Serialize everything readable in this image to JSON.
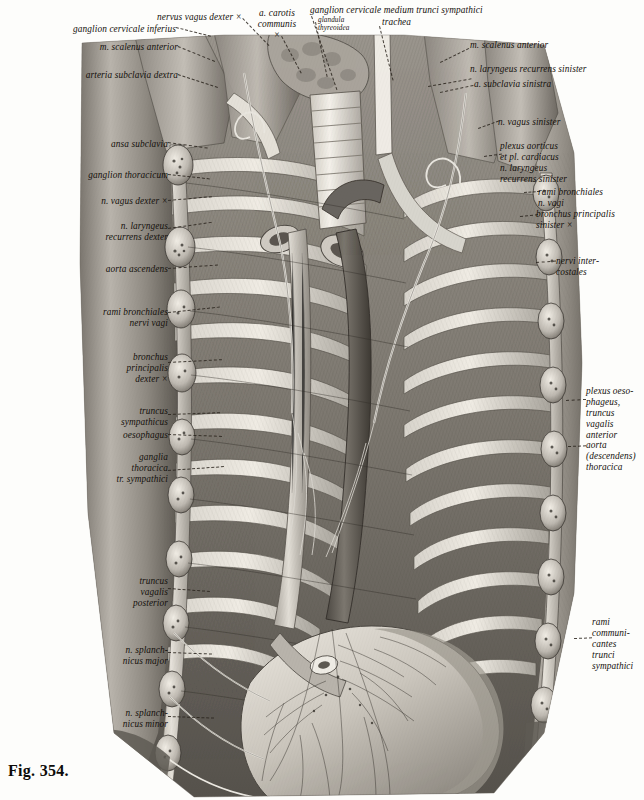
{
  "figure": {
    "caption": "Fig. 354.",
    "background_color": "#fdfdfb",
    "ink_color": "#14100c"
  },
  "labels_top": [
    {
      "id": "ganglion-cervicale-inferius",
      "text": "ganglion cervicale inferius",
      "align": "right",
      "x": 4,
      "y": 24,
      "w": 172
    },
    {
      "id": "nervus-vagus-dexter",
      "text": "nervus vagus dexter ×",
      "align": "right",
      "x": 70,
      "y": 12,
      "w": 172
    },
    {
      "id": "a-carotis-communis",
      "text": "a. carotis\ncommunis\n×",
      "align": "center",
      "x": 246,
      "y": 8,
      "w": 62
    },
    {
      "id": "ganglion-cervicale-medium",
      "text": "ganglion cervicale medium trunci sympathici",
      "align": "left",
      "x": 310,
      "y": 5,
      "w": 280
    },
    {
      "id": "glandula-thyreoidea",
      "text": "glandula\nthyreoidea",
      "align": "left",
      "x": 318,
      "y": 16,
      "w": 54,
      "tiny": true
    },
    {
      "id": "trachea",
      "text": "trachea",
      "align": "left",
      "x": 382,
      "y": 17,
      "w": 50
    },
    {
      "id": "m-scalenus-anterior-left",
      "text": "m. scalenus anterior",
      "align": "right",
      "x": 2,
      "y": 42,
      "w": 176
    },
    {
      "id": "arteria-subclavia-dextra",
      "text": "arteria subclavia dextra",
      "align": "right",
      "x": 2,
      "y": 70,
      "w": 176
    },
    {
      "id": "m-scalenus-anterior-right",
      "text": "m. scalenus anterior",
      "align": "left",
      "x": 470,
      "y": 40,
      "w": 160
    },
    {
      "id": "n-laryngeus-recurrens-sinister-top",
      "text": "n. laryngeus recurrens sinister",
      "align": "left",
      "x": 470,
      "y": 64,
      "w": 172
    },
    {
      "id": "a-subclavia-sinistra",
      "text": "a. subclavia sinistra",
      "align": "left",
      "x": 474,
      "y": 79,
      "w": 166
    }
  ],
  "labels_left": [
    {
      "id": "ansa-subclavia",
      "text": "ansa subclavia",
      "x": 2,
      "y": 139,
      "w": 166
    },
    {
      "id": "ganglion-thoracicum",
      "text": "ganglion thoracicum",
      "x": 2,
      "y": 170,
      "w": 166
    },
    {
      "id": "n-vagus-dexter",
      "text": "n. vagus dexter ×",
      "x": 2,
      "y": 196,
      "w": 166
    },
    {
      "id": "n-laryngeus-recurrens-dexter",
      "text": "n. laryngeus\nrecurrens dexter",
      "x": 2,
      "y": 221,
      "w": 166
    },
    {
      "id": "aorta-ascendens",
      "text": "aorta ascendens",
      "x": 2,
      "y": 264,
      "w": 166
    },
    {
      "id": "rami-bronchiales-nervi-vagi",
      "text": "rami bronchiales\nnervi vagi",
      "x": 2,
      "y": 307,
      "w": 166
    },
    {
      "id": "bronchus-principalis-dexter",
      "text": "bronchus\nprincipalis\ndexter ×",
      "x": 2,
      "y": 352,
      "w": 166
    },
    {
      "id": "truncus-sympathicus",
      "text": "truncus\nsympathicus",
      "x": 2,
      "y": 406,
      "w": 166
    },
    {
      "id": "oesophagus",
      "text": "oesophagus",
      "x": 2,
      "y": 430,
      "w": 166
    },
    {
      "id": "ganglia-thoracica",
      "text": "ganglia\nthoracica\ntr. sympathici",
      "x": 2,
      "y": 452,
      "w": 166
    },
    {
      "id": "truncus-vagalis-posterior",
      "text": "truncus\nvagalis\nposterior",
      "x": 2,
      "y": 576,
      "w": 166
    },
    {
      "id": "n-splanchnicus-major",
      "text": "n. splanch-\nnicus major",
      "x": 2,
      "y": 645,
      "w": 166
    },
    {
      "id": "n-splanchnicus-minor",
      "text": "n. splanch-\nnicus minor",
      "x": 2,
      "y": 708,
      "w": 166
    }
  ],
  "labels_right": [
    {
      "id": "n-vagus-sinister",
      "text": "n. vagus sinister",
      "x": 498,
      "y": 117,
      "w": 146
    },
    {
      "id": "plexus-aorticus-cardiacus",
      "text": "plexus aorticus\net pl. cardiacus\nn. laryngeus\nrecurrens sinister",
      "x": 500,
      "y": 141,
      "w": 144
    },
    {
      "id": "rami-bronchiales-n-vagi",
      "text": "rami bronchiales\nn. vagi",
      "x": 538,
      "y": 187,
      "w": 106
    },
    {
      "id": "bronchus-principalis-sinister",
      "text": "bronchus principalis\nsinister ×",
      "x": 536,
      "y": 209,
      "w": 108
    },
    {
      "id": "nervi-intercostales",
      "text": "nervi inter-\ncostales",
      "x": 556,
      "y": 256,
      "w": 88
    },
    {
      "id": "plexus-oesophageus",
      "text": "plexus oeso-\nphageus,\ntruncus\nvagalis\nanterior",
      "x": 586,
      "y": 386,
      "w": 58
    },
    {
      "id": "aorta-descendens-thoracica",
      "text": "aorta\n(descendens)\nthoracica",
      "x": 586,
      "y": 440,
      "w": 58
    },
    {
      "id": "rami-communicantes",
      "text": "rami\ncommuni-\ncantes\ntrunci\nsympathici",
      "x": 592,
      "y": 617,
      "w": 52
    }
  ],
  "leaders": [
    {
      "id": "lead-ganglion-cervicale-inferius",
      "x": 176,
      "y": 27,
      "len": 36,
      "ang": 14
    },
    {
      "id": "lead-nervus-vagus-dexter",
      "x": 243,
      "y": 18,
      "len": 38,
      "ang": 46
    },
    {
      "id": "lead-a-carotis-communis",
      "x": 282,
      "y": 36,
      "len": 42,
      "ang": 62
    },
    {
      "id": "lead-ganglion-cervicale-medium",
      "x": 312,
      "y": 16,
      "len": 78,
      "ang": 71
    },
    {
      "id": "lead-glandula-thyreoidea",
      "x": 316,
      "y": 22,
      "len": 56,
      "ang": 78
    },
    {
      "id": "lead-trachea",
      "x": 380,
      "y": 26,
      "len": 56,
      "ang": 76
    },
    {
      "id": "lead-m-scalenus-anterior-left",
      "x": 178,
      "y": 46,
      "len": 40,
      "ang": 22
    },
    {
      "id": "lead-arteria-subclavia-dextra",
      "x": 178,
      "y": 74,
      "len": 42,
      "ang": 18
    },
    {
      "id": "lead-m-scalenus-anterior-right",
      "x": 440,
      "y": 62,
      "len": 32,
      "ang": -26
    },
    {
      "id": "lead-n-laryngeus-recurrens-sinister-top",
      "x": 428,
      "y": 86,
      "len": 44,
      "ang": -10
    },
    {
      "id": "lead-a-subclavia-sinistra",
      "x": 440,
      "y": 92,
      "len": 34,
      "ang": -12
    },
    {
      "id": "lead-ansa-subclavia",
      "x": 168,
      "y": 142,
      "len": 40,
      "ang": 8
    },
    {
      "id": "lead-ganglion-thoracicum",
      "x": 168,
      "y": 174,
      "len": 42,
      "ang": 6
    },
    {
      "id": "lead-n-vagus-dexter",
      "x": 168,
      "y": 200,
      "len": 44,
      "ang": -5
    },
    {
      "id": "lead-n-laryngeus-recurrens-dexter",
      "x": 168,
      "y": 228,
      "len": 44,
      "ang": -8
    },
    {
      "id": "lead-aorta-ascendens",
      "x": 168,
      "y": 268,
      "len": 50,
      "ang": -4
    },
    {
      "id": "lead-rami-bronchiales-nervi-vagi",
      "x": 168,
      "y": 312,
      "len": 52,
      "ang": -6
    },
    {
      "id": "lead-bronchus-principalis-dexter",
      "x": 168,
      "y": 362,
      "len": 54,
      "ang": -3
    },
    {
      "id": "lead-truncus-sympathicus",
      "x": 168,
      "y": 414,
      "len": 52,
      "ang": -2
    },
    {
      "id": "lead-oesophagus",
      "x": 168,
      "y": 434,
      "len": 54,
      "ang": 2
    },
    {
      "id": "lead-ganglia-thoracica",
      "x": 168,
      "y": 470,
      "len": 56,
      "ang": -4
    },
    {
      "id": "lead-truncus-vagalis-posterior",
      "x": 168,
      "y": 588,
      "len": 42,
      "ang": 4
    },
    {
      "id": "lead-n-splanchnicus-major",
      "x": 168,
      "y": 652,
      "len": 44,
      "ang": 2
    },
    {
      "id": "lead-n-splanchnicus-minor",
      "x": 168,
      "y": 716,
      "len": 46,
      "ang": 2
    },
    {
      "id": "lead-n-vagus-sinister",
      "x": 478,
      "y": 128,
      "len": 22,
      "ang": -20
    },
    {
      "id": "lead-plexus-aorticus",
      "x": 484,
      "y": 156,
      "len": 18,
      "ang": -8
    },
    {
      "id": "lead-rami-bronchiales-n-vagi",
      "x": 524,
      "y": 192,
      "len": 16,
      "ang": -4
    },
    {
      "id": "lead-bronchus-principalis-sinister",
      "x": 520,
      "y": 216,
      "len": 18,
      "ang": -6
    },
    {
      "id": "lead-nervi-intercostales",
      "x": 536,
      "y": 262,
      "len": 20,
      "ang": -4
    },
    {
      "id": "lead-plexus-oesophageus",
      "x": 566,
      "y": 400,
      "len": 20,
      "ang": -3
    },
    {
      "id": "lead-aorta-descendens",
      "x": 568,
      "y": 446,
      "len": 18,
      "ang": -2
    },
    {
      "id": "lead-rami-communicantes",
      "x": 574,
      "y": 638,
      "len": 18,
      "ang": -2
    }
  ]
}
